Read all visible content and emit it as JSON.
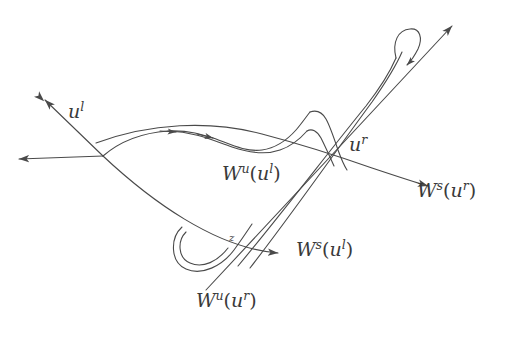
{
  "figure": {
    "type": "mathematical-diagram",
    "width": 523,
    "height": 341,
    "background_color": "#ffffff",
    "stroke_color": "#4a4a4a",
    "label_color": "#3a3a3a",
    "stroke_width": 1.1
  },
  "labels": {
    "u_left": {
      "base": "u",
      "sup": "l",
      "x": 68,
      "y": 110
    },
    "u_right": {
      "base": "u",
      "sup": "r",
      "x": 349,
      "y": 142
    },
    "Wu_ul": {
      "base": "W",
      "sup": "u",
      "arg_base": "u",
      "arg_sup": "l",
      "x": 222,
      "y": 170
    },
    "Ws_ur": {
      "base": "W",
      "sup": "s",
      "arg_base": "u",
      "arg_sup": "r",
      "x": 417,
      "y": 187
    },
    "Ws_ul": {
      "base": "W",
      "sup": "s",
      "arg_base": "u",
      "arg_sup": "l",
      "x": 296,
      "y": 246
    },
    "Wu_ur": {
      "base": "W",
      "sup": "u",
      "arg_base": "u",
      "arg_sup": "r",
      "x": 196,
      "y": 297
    },
    "z_point": {
      "base": "z",
      "x": 229,
      "y": 235
    }
  },
  "curves": {
    "Ws_ul_line": {
      "name": "stable-manifold-u-left",
      "description": "Gently curving line from upper-left arrowhead through u-left down to lower-right arrowhead near W^s(u^l) label"
    },
    "Wu_ul_curve": {
      "name": "unstable-manifold-u-left",
      "description": "Curve starting upper-left, arcing right with wavy oscillations and a tall narrow spike near center-right"
    },
    "Ws_ur_line": {
      "name": "stable-manifold-u-right",
      "description": "Curve from upper-left region descending through u-right toward lower-right arrowhead at W^s(u^r)"
    },
    "Wu_ur_line": {
      "name": "unstable-manifold-u-right",
      "description": "Steep line from lower-left W^u(u^r) label rising to upper-right arrowhead with a narrow fold"
    },
    "lower_fold": {
      "name": "lower-left-u-fold",
      "description": "U-shaped fold of the unstable manifold near point z"
    },
    "upper_fold": {
      "name": "upper-right-narrow-fold",
      "description": "Narrow elongated fold turning back near the upper-right arrowhead"
    }
  },
  "arrowheads": [
    {
      "name": "arrow-upper-left-unstable",
      "x": 38,
      "y": 96,
      "direction": "up-left"
    },
    {
      "name": "arrow-left-stable",
      "x": 12,
      "y": 159,
      "direction": "left"
    },
    {
      "name": "arrow-mid-unstable-1",
      "x": 176,
      "y": 133,
      "direction": "right"
    },
    {
      "name": "arrow-mid-unstable-2",
      "x": 212,
      "y": 138,
      "direction": "right"
    },
    {
      "name": "arrow-upper-right-unstable",
      "x": 448,
      "y": 22,
      "direction": "up-right"
    },
    {
      "name": "arrow-fold-down",
      "x": 405,
      "y": 54,
      "direction": "down"
    },
    {
      "name": "arrow-lower-right-stable-ur",
      "x": 432,
      "y": 182,
      "direction": "down-right"
    },
    {
      "name": "arrow-lower-right-stable-ul",
      "x": 285,
      "y": 254,
      "direction": "right"
    }
  ]
}
